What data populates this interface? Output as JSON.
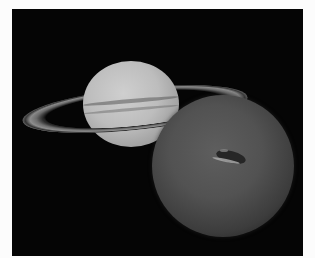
{
  "image": {
    "description": "Grayscale montage of Saturn with its rings and Neptune with its Great Dark Spot against a black background",
    "background_color": "#fcfcfc",
    "panel_color": "#050505",
    "objects": [
      {
        "name": "Saturn",
        "feature": "rings",
        "tone": "#bdbdbd"
      },
      {
        "name": "Neptune",
        "feature": "Great Dark Spot",
        "tone": "#525252"
      }
    ]
  }
}
